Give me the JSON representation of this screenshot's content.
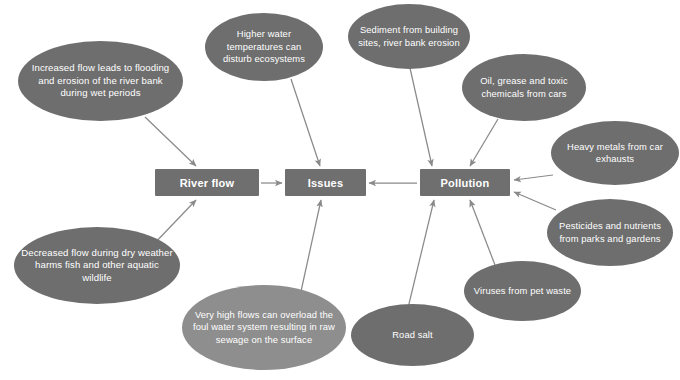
{
  "diagram": {
    "colors": {
      "background": "#ffffff",
      "node_dark": "#6e6e6e",
      "node_light": "#8e8e8e",
      "box_fill": "#6f6f6f",
      "text": "#ffffff",
      "connector": "#8a8a8a"
    },
    "boxes": [
      {
        "id": "river-flow",
        "label": "River flow",
        "x": 155,
        "y": 169,
        "w": 104,
        "h": 27
      },
      {
        "id": "issues",
        "label": "Issues",
        "x": 285,
        "y": 169,
        "w": 81,
        "h": 27
      },
      {
        "id": "pollution",
        "label": "Pollution",
        "x": 420,
        "y": 169,
        "w": 90,
        "h": 27
      }
    ],
    "ellipses": [
      {
        "id": "increased-flow",
        "label": "Increased flow leads to flooding and erosion of the river bank during wet periods",
        "x": 18,
        "y": 41,
        "w": 165,
        "h": 80,
        "font": 9.6,
        "shade": "dark",
        "target": "river-flow"
      },
      {
        "id": "higher-water-temperatures",
        "label": "Higher water temperatures can disturb ecosystems",
        "x": 205,
        "y": 13,
        "w": 118,
        "h": 68,
        "font": 9.4,
        "shade": "dark",
        "target": "issues"
      },
      {
        "id": "sediment",
        "label": "Sediment from building sites, river bank erosion",
        "x": 348,
        "y": 4,
        "w": 122,
        "h": 65,
        "font": 9.4,
        "shade": "dark",
        "target": "pollution"
      },
      {
        "id": "oil-grease",
        "label": "Oil, grease and toxic chemicals from cars",
        "x": 462,
        "y": 54,
        "w": 124,
        "h": 67,
        "font": 9.4,
        "shade": "dark",
        "target": "pollution"
      },
      {
        "id": "heavy-metals",
        "label": "Heavy metals from car exhausts",
        "x": 551,
        "y": 121,
        "w": 128,
        "h": 64,
        "font": 9.4,
        "shade": "dark",
        "target": "pollution"
      },
      {
        "id": "pesticides",
        "label": "Pesticides and nutrients from parks and gardens",
        "x": 547,
        "y": 199,
        "w": 126,
        "h": 67,
        "font": 9.4,
        "shade": "dark",
        "target": "pollution"
      },
      {
        "id": "viruses",
        "label": "Viruses from pet waste",
        "x": 464,
        "y": 261,
        "w": 117,
        "h": 60,
        "font": 9.4,
        "shade": "dark",
        "target": "pollution"
      },
      {
        "id": "road-salt",
        "label": "Road salt",
        "x": 351,
        "y": 304,
        "w": 123,
        "h": 62,
        "font": 9.4,
        "shade": "dark",
        "target": "pollution"
      },
      {
        "id": "very-high-flows",
        "label": "Very high flows can overload the foul water system resulting in raw sewage on the surface",
        "x": 182,
        "y": 285,
        "w": 164,
        "h": 85,
        "font": 9.4,
        "shade": "light",
        "target": "issues"
      },
      {
        "id": "decreased-flow",
        "label": "Decreased flow during dry weather harms fish and other aquatic wildlife",
        "x": 14,
        "y": 227,
        "w": 166,
        "h": 77,
        "font": 9.6,
        "shade": "dark",
        "target": "river-flow"
      }
    ],
    "connectors": [
      {
        "id": "increased-flow-to-river-flow",
        "from": "increased-flow",
        "to": "river-flow",
        "x1": 145,
        "y1": 117,
        "x2": 196,
        "y2": 166
      },
      {
        "id": "decreased-flow-to-river-flow",
        "from": "decreased-flow",
        "to": "river-flow",
        "x1": 152,
        "y1": 246,
        "x2": 196,
        "y2": 200
      },
      {
        "id": "higher-water-to-issues",
        "from": "higher-water-temperatures",
        "to": "issues",
        "x1": 291,
        "y1": 79,
        "x2": 320,
        "y2": 166
      },
      {
        "id": "very-high-flows-to-issues",
        "from": "very-high-flows",
        "to": "issues",
        "x1": 300,
        "y1": 296,
        "x2": 321,
        "y2": 200
      },
      {
        "id": "river-flow-to-issues",
        "from": "river-flow",
        "to": "issues",
        "x1": 261,
        "y1": 183,
        "x2": 282,
        "y2": 183
      },
      {
        "id": "pollution-to-issues",
        "from": "pollution",
        "to": "issues",
        "x1": 417,
        "y1": 183,
        "x2": 369,
        "y2": 183
      },
      {
        "id": "sediment-to-pollution",
        "from": "sediment",
        "to": "pollution",
        "x1": 410,
        "y1": 68,
        "x2": 432,
        "y2": 166
      },
      {
        "id": "oil-grease-to-pollution",
        "from": "oil-grease",
        "to": "pollution",
        "x1": 498,
        "y1": 119,
        "x2": 470,
        "y2": 166
      },
      {
        "id": "heavy-metals-to-pollution",
        "from": "heavy-metals",
        "to": "pollution",
        "x1": 553,
        "y1": 175,
        "x2": 514,
        "y2": 180
      },
      {
        "id": "pesticides-to-pollution",
        "from": "pesticides",
        "to": "pollution",
        "x1": 556,
        "y1": 210,
        "x2": 514,
        "y2": 192
      },
      {
        "id": "viruses-to-pollution",
        "from": "viruses",
        "to": "pollution",
        "x1": 495,
        "y1": 265,
        "x2": 470,
        "y2": 200
      },
      {
        "id": "road-salt-to-pollution",
        "from": "road-salt",
        "to": "pollution",
        "x1": 408,
        "y1": 308,
        "x2": 434,
        "y2": 200
      }
    ]
  }
}
